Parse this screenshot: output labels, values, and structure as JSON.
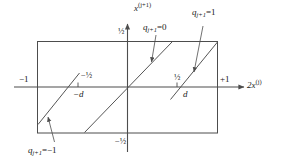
{
  "figure": {
    "type": "diagram",
    "axes": {
      "x_axis_label_base": "2x",
      "x_axis_label_sup": "(j)",
      "y_axis_label_base": "x",
      "y_axis_label_sup": "(j+1)",
      "x_tick_left": "−1",
      "x_tick_right": "+1",
      "x_tick_minus_half": "−½",
      "x_tick_plus_half": "½",
      "x_tick_minus_d": "−d",
      "x_tick_plus_d": "d",
      "y_tick_top": "½",
      "y_tick_bottom": "−½"
    },
    "annotations": {
      "q_zero": "q",
      "q_zero_sub": "j+1",
      "q_zero_eq": "=0",
      "q_one": "q",
      "q_one_sub": "j+1",
      "q_one_eq": "=1",
      "q_minus_one": "q",
      "q_minus_one_sub": "j+1",
      "q_minus_one_eq": "=−1"
    },
    "colors": {
      "stroke": "#4d4d4d",
      "line": "#555555",
      "text": "#1a1a1a"
    }
  }
}
